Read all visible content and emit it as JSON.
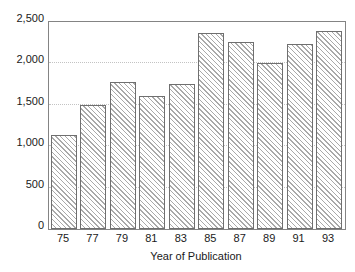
{
  "chart_data": {
    "type": "bar",
    "title": "",
    "xlabel": "Year of Publication",
    "ylabel": "",
    "categories": [
      "75",
      "77",
      "79",
      "81",
      "83",
      "85",
      "87",
      "89",
      "91",
      "93"
    ],
    "values": [
      1130,
      1500,
      1780,
      1610,
      1755,
      2370,
      2260,
      2000,
      2240,
      2390
    ],
    "ylim": [
      0,
      2500
    ],
    "yticks": [
      {
        "value": 0,
        "label": "0"
      },
      {
        "value": 500,
        "label": "500"
      },
      {
        "value": 1000,
        "label": "1,000"
      },
      {
        "value": 1500,
        "label": "1,500"
      },
      {
        "value": 2000,
        "label": "2,000"
      },
      {
        "value": 2500,
        "label": "2,500"
      }
    ],
    "grid": "horizontal-dotted",
    "legend": "none",
    "bar_style": {
      "fill": "#ffffff",
      "hatch": "diagonal-backslash",
      "hatch_color": "#a9a9a9",
      "outline": "#6f6f6f"
    },
    "colors": {
      "background": "#ffffff",
      "axis": "#848484",
      "gridline": "#c3c3c3",
      "text": "#1a1a1a"
    }
  }
}
